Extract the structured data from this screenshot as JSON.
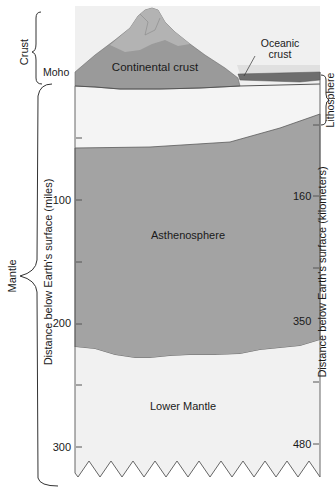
{
  "diagram": {
    "type": "earth-layers-cross-section",
    "colors": {
      "background": "#ffffff",
      "crust_sky": "#f0f0f0",
      "continental_crust": "#9a9a9a",
      "mountain_light": "#b4b4b4",
      "oceanic_crust": "#6e6e6e",
      "ocean_water": "#dcdcdc",
      "lithosphere_mantle": "#f3f3f3",
      "asthenosphere": "#a3a3a3",
      "lower_mantle": "#f1f1f1",
      "line": "#555555"
    },
    "layers": {
      "continental_crust": "Continental crust",
      "oceanic_crust_line1": "Oceanic",
      "oceanic_crust_line2": "crust",
      "asthenosphere": "Asthenosphere",
      "lower_mantle": "Lower Mantle"
    },
    "brackets": {
      "crust": "Crust",
      "moho": "Moho",
      "mantle": "Mantle",
      "lithosphere": "Lithosphere"
    },
    "left_axis": {
      "label": "Distance below Earth's surface (miles)",
      "ticks": [
        "100",
        "200",
        "300"
      ]
    },
    "right_axis": {
      "label": "Distance below Earth's surface (kilometers)",
      "ticks": [
        "160",
        "350",
        "480"
      ]
    }
  }
}
